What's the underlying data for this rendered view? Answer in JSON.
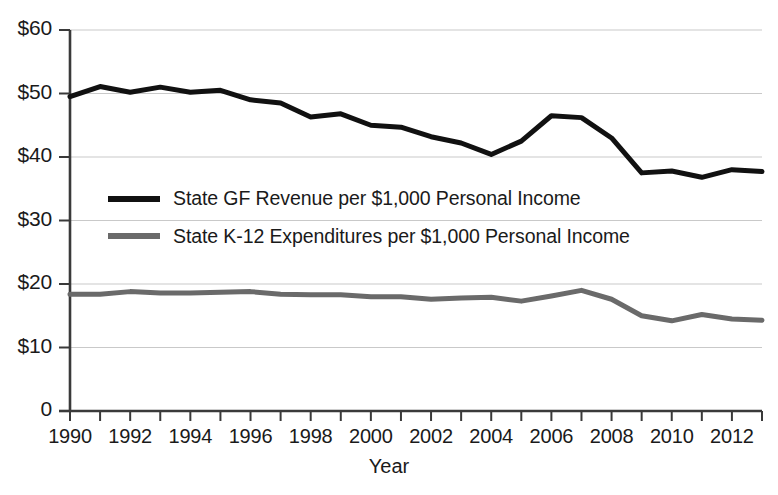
{
  "chart_data": {
    "type": "line",
    "title": "",
    "xlabel": "Year",
    "ylabel": "",
    "xlim": [
      1990,
      2013
    ],
    "ylim": [
      0,
      60
    ],
    "grid": true,
    "legend_position": "inside-upper-left",
    "x": [
      1990,
      1991,
      1992,
      1993,
      1994,
      1995,
      1996,
      1997,
      1998,
      1999,
      2000,
      2001,
      2002,
      2003,
      2004,
      2005,
      2006,
      2007,
      2008,
      2009,
      2010,
      2011,
      2012,
      2013
    ],
    "y_tick_labels": [
      "0",
      "$10",
      "$20",
      "$30",
      "$40",
      "$50",
      "$60"
    ],
    "y_tick_values": [
      0,
      10,
      20,
      30,
      40,
      50,
      60
    ],
    "x_tick_labels": [
      "1990",
      "1992",
      "1994",
      "1996",
      "1998",
      "2000",
      "2002",
      "2004",
      "2006",
      "2008",
      "2010",
      "2012"
    ],
    "x_tick_values": [
      1990,
      1992,
      1994,
      1996,
      1998,
      2000,
      2002,
      2004,
      2006,
      2008,
      2010,
      2012
    ],
    "series": [
      {
        "name": "State GF Revenue per $1,000 Personal Income",
        "color": "#111111",
        "width": 5.0,
        "values": [
          49.5,
          51.1,
          50.2,
          51.0,
          50.2,
          50.5,
          49.0,
          48.5,
          46.3,
          46.8,
          45.0,
          44.7,
          43.2,
          42.2,
          40.4,
          42.5,
          46.5,
          46.2,
          43.0,
          37.5,
          37.8,
          36.8,
          38.0,
          37.7
        ]
      },
      {
        "name": "State K-12 Expenditures per $1,000 Personal Income",
        "color": "#6a6a6a",
        "width": 5.0,
        "values": [
          18.4,
          18.4,
          18.8,
          18.6,
          18.6,
          18.7,
          18.8,
          18.4,
          18.3,
          18.3,
          18.0,
          18.0,
          17.6,
          17.8,
          17.9,
          17.3,
          18.1,
          19.0,
          17.6,
          15.0,
          14.2,
          15.2,
          14.5,
          14.3
        ]
      }
    ]
  },
  "axis": {
    "x_title": "Year"
  },
  "legend": [
    {
      "label": "State GF Revenue per $1,000 Personal Income",
      "color": "#111111"
    },
    {
      "label": "State K-12 Expenditures per $1,000 Personal Income",
      "color": "#6a6a6a"
    }
  ]
}
